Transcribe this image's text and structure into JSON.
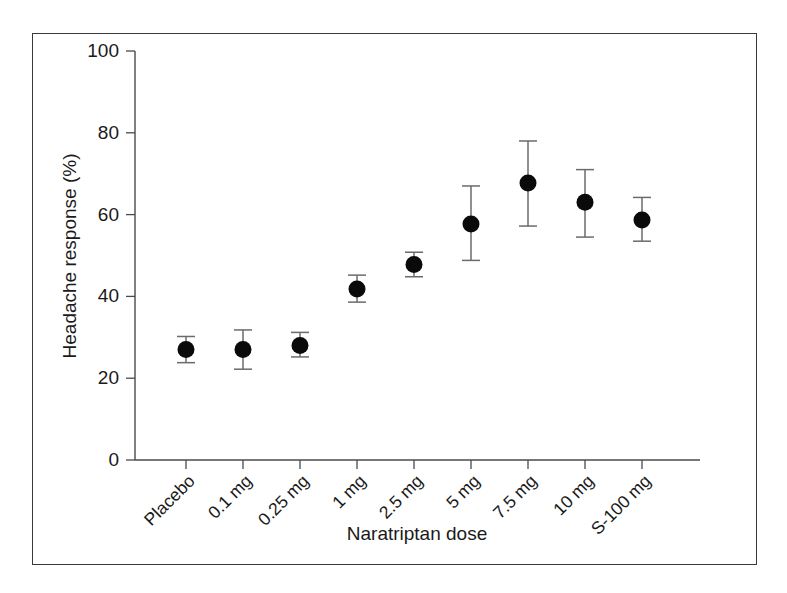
{
  "figure": {
    "frame_color": "#3a3a3a",
    "background": "#ffffff"
  },
  "chart_data": {
    "type": "scatter",
    "title": "",
    "subtitle": "",
    "xlabel": "Naratriptan dose",
    "ylabel": "Headache response (%)",
    "categories": [
      "Placebo",
      "0.1 mg",
      "0.25 mg",
      "1 mg",
      "2.5 mg",
      "5 mg",
      "7.5 mg",
      "10 mg",
      "S-100 mg"
    ],
    "values": [
      27.0,
      27.0,
      28.0,
      41.8,
      47.8,
      57.7,
      67.7,
      63.0,
      58.7
    ],
    "error_low": [
      23.8,
      22.2,
      25.2,
      38.6,
      44.8,
      48.8,
      57.2,
      54.5,
      53.5
    ],
    "error_high": [
      30.2,
      31.8,
      31.2,
      45.2,
      50.8,
      67.0,
      78.0,
      71.0,
      64.2
    ],
    "error_bar_type": "95% confidence interval",
    "ylim": [
      0,
      100
    ],
    "yticks": [
      0,
      20,
      40,
      60,
      80,
      100
    ],
    "ytick_labels": [
      "0",
      "20",
      "40",
      "60",
      "80",
      "100"
    ],
    "xtick_rotation_deg": -45,
    "grid": false,
    "legend": null,
    "marker": "filled-circle",
    "marker_color": "#0a0a0a",
    "errorbar_color": "#6b6b6b",
    "axis_color": "#4a4a4a",
    "series_name": "Headache response"
  }
}
